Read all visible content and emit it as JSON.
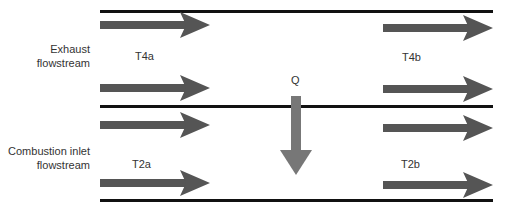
{
  "diagram": {
    "type": "heat-exchanger-flow",
    "streams": [
      {
        "name": "exhaust",
        "label": "Exhaust\nflowstream",
        "label_lines": [
          "Exhaust",
          "flowstream"
        ],
        "inlet_temp": "T4a",
        "outlet_temp": "T4b"
      },
      {
        "name": "combustion-inlet",
        "label": "Combustion inlet\nflowstream",
        "label_lines": [
          "Combustion inlet",
          "flowstream"
        ],
        "inlet_temp": "T2a",
        "outlet_temp": "T2b"
      }
    ],
    "heat_transfer_label": "Q",
    "colors": {
      "flow_arrow": "#555555",
      "heat_arrow": "#777777",
      "wall": "#111111"
    }
  }
}
